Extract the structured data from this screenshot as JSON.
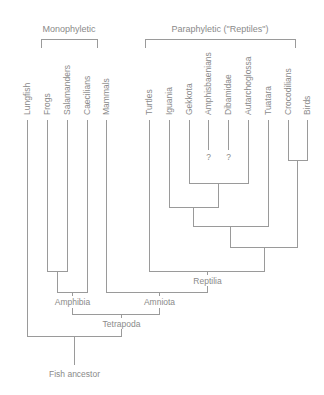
{
  "groups": {
    "monophyletic": "Monophyletic",
    "paraphyletic": "Paraphyletic (\"Reptiles\")"
  },
  "taxa": [
    {
      "name": "Lungfish",
      "x": 27
    },
    {
      "name": "Frogs",
      "x": 47
    },
    {
      "name": "Salamanders",
      "x": 67
    },
    {
      "name": "Caecilians",
      "x": 87
    },
    {
      "name": "Mammals",
      "x": 106
    },
    {
      "name": "Turtles",
      "x": 149
    },
    {
      "name": "Iguania",
      "x": 169
    },
    {
      "name": "Gekkota",
      "x": 189
    },
    {
      "name": "Amphisbaenians",
      "x": 208
    },
    {
      "name": "Dibamidae",
      "x": 228
    },
    {
      "name": "Autarchoglossa",
      "x": 248
    },
    {
      "name": "Tuatara",
      "x": 268
    },
    {
      "name": "Crocodilians",
      "x": 288
    },
    {
      "name": "Birds",
      "x": 307
    }
  ],
  "uncertain_mark": "?",
  "clades": {
    "reptilia": "Reptilia",
    "amphibia": "Amphibia",
    "amniota": "Amniota",
    "tetrapoda": "Tetrapoda",
    "root": "Fish ancestor"
  },
  "colors": {
    "line": "#9a9a9a",
    "text": "#8a8a8a"
  }
}
